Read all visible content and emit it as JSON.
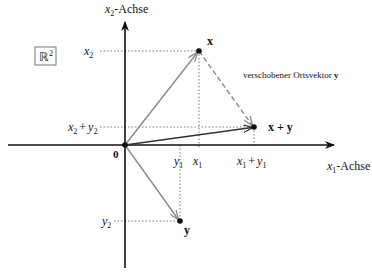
{
  "diagram": {
    "space_label": "ℝ",
    "space_exponent": "2",
    "axes": {
      "x_axis_label_var": "x",
      "x_axis_label_sub": "1",
      "x_axis_label_suffix": "-Achse",
      "y_axis_label_var": "x",
      "y_axis_label_sub": "2",
      "y_axis_label_suffix": "-Achse",
      "origin_label": "0"
    },
    "points": {
      "x": {
        "label": "x"
      },
      "y": {
        "label": "y"
      },
      "sum": {
        "label": "x + y"
      }
    },
    "ticks": {
      "x1": {
        "var": "x",
        "sub": "1"
      },
      "y1": {
        "var": "y",
        "sub": "1"
      },
      "x1y1": {
        "a_var": "x",
        "a_sub": "1",
        "op": "+",
        "b_var": "y",
        "b_sub": "1"
      },
      "x2": {
        "var": "x",
        "sub": "2"
      },
      "y2": {
        "var": "y",
        "sub": "2"
      },
      "x2y2": {
        "a_var": "x",
        "a_sub": "2",
        "op": "+",
        "b_var": "y",
        "b_sub": "2"
      }
    },
    "annotation": {
      "text": "verschobener Ortsvektor ",
      "bold_part": "y"
    },
    "colors": {
      "axis": "#111111",
      "vector_xy": "#8a8a8a",
      "vector_sum": "#333333",
      "dotted_guides": "#777777"
    }
  }
}
